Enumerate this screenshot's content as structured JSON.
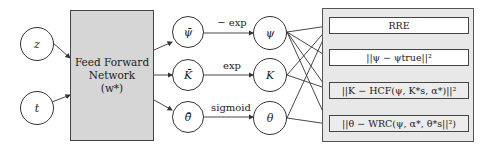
{
  "inputs": [
    {
      "id": "z",
      "label": "z"
    },
    {
      "id": "t",
      "label": "t"
    }
  ],
  "network": {
    "line1": "Feed Forward",
    "line2": "Network",
    "line3": "(w*)"
  },
  "raw_outputs": [
    {
      "id": "psi_bar",
      "label": "ψ̄"
    },
    {
      "id": "K_bar",
      "label": "K̄"
    },
    {
      "id": "theta_bar",
      "label": "θ̄"
    }
  ],
  "transforms": [
    "− exp",
    "exp",
    "sigmoid"
  ],
  "outputs": [
    {
      "id": "psi",
      "label": "ψ"
    },
    {
      "id": "K",
      "label": "K"
    },
    {
      "id": "theta",
      "label": "θ"
    }
  ],
  "losses": [
    {
      "id": "rre",
      "label": "RRE"
    },
    {
      "id": "psi_loss",
      "label": "||ψ − ψtrue||²"
    },
    {
      "id": "hcf_loss",
      "label": "||K − HCF(ψ, K*s, α*)||²"
    },
    {
      "id": "wrc_loss",
      "label": "||θ − WRC(ψ, α*, θ*s||²)"
    }
  ],
  "connections": {
    "psi": [
      "rre",
      "psi_loss",
      "hcf_loss",
      "wrc_loss"
    ],
    "K": [
      "rre",
      "hcf_loss"
    ],
    "theta": [
      "rre",
      "wrc_loss"
    ]
  }
}
